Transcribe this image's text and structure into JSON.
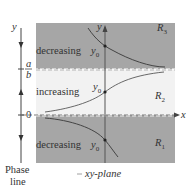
{
  "diagram": {
    "phase_line": {
      "axis_label": "y",
      "marks": [
        "a/b",
        "0"
      ],
      "mark_a_numerator": "a",
      "mark_a_denominator": "b",
      "mark_zero": "0",
      "caption_line1": "Phase",
      "caption_line2": "line",
      "arrows": [
        "down",
        "up",
        "down"
      ]
    },
    "plane": {
      "y_axis_label": "y",
      "x_axis_label": "x",
      "caption": "xy-plane",
      "regions": [
        {
          "name": "R3",
          "label_main": "R",
          "label_sub": "3",
          "behavior": "decreasing",
          "y0_label": "y0",
          "shade": "#a6a6a6"
        },
        {
          "name": "R2",
          "label_main": "R",
          "label_sub": "2",
          "behavior": "increasing",
          "y0_label": "y0",
          "shade": "#f2f2f2"
        },
        {
          "name": "R1",
          "label_main": "R",
          "label_sub": "1",
          "behavior": "decreasing",
          "y0_label": "y0",
          "shade": "#a6a6a6"
        }
      ]
    },
    "colors": {
      "dark_region": "#a6a6a6",
      "light_region": "#f2f2f2",
      "line": "#444444",
      "dashed": "#ffffff"
    }
  }
}
